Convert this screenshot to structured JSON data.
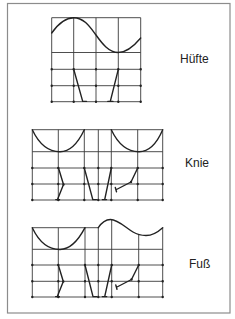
{
  "figure": {
    "frame_color": "#8c8c8c",
    "grid_color": "#3a3a3a",
    "line_color": "#222222",
    "text_color": "#222222"
  },
  "panels": [
    {
      "label": "Hüfte",
      "joint": "hip",
      "curve_shape": "sinusoid: peak at 1st gridline, trough at 3rd gridline",
      "grid": "M51.7,17.7V101.7M73.7,17.7V101.7M96,17.7V101.7M118.3,17.7V101.7M140.7,17.7V101.7M51.7,17.7H140.7M51.7,52.5H140.7M51.7,69.3H140.7M51.7,85.7H140.7M51.7,101.7H140.7",
      "curve": "M51.7,33C58,24 65,17.7 73.7,17.7C84,17.7 90,27 96,35C102,43.5 109,52.5 118.3,52.5C127,52.5 134,46 140.7,38",
      "legs": "M73.7,69.3L82.7,101.4H86.5M118.3,69.3L110.3,101.4M107.8,101.4H113",
      "joints": "M51.7,69.3h.01M73.7,69.3h.01M96,69.3h.01M118.3,69.3h.01M140.7,69.3h.01M51.7,85.7h.01M73.7,85.7h.01M96,85.7h.01M118.3,85.7h.01M140.7,85.7h.01M51.7,101.7h.01M73.7,101.7h.01M96,101.7h.01M118.3,101.7h.01M140.7,101.7h.01"
    },
    {
      "label": "Knie",
      "joint": "knee",
      "curve_shape": "two U-shaped flexion curves separated by flat segment",
      "grid": "M32.3,129.7V200M58.3,129.7V200M84.3,129.7V200M98.3,129.7V200M111.3,129.7V200M137.7,129.7V200M162.7,129.7V200M32.3,129.7H162.7M32.3,151.7H162.7M32.3,168H162.7M32.3,184H162.7M32.3,200H162.7",
      "curve": "M32.3,129.7C40,146 50,151.7 60,151.7C70,151.7 78,143 84.3,129.7M111.3,129.7C119,146 129,151.7 139,151.7C149,151.7 157,143 162.7,129.7",
      "legs": "M58.5,168L63.5,184.5L57.5,199.6M55.8,199.6H59.6M84.3,168L92.8,199.6H96.5M111.3,168L104.7,199.6M102.3,199.6H106.5M137.7,168L131,182L116.5,189.5M115.3,187.5L116.5,191.8",
      "joints": "M32.3,168h.01M58.3,168h.01M84.3,168h.01M98.3,168h.01M111.3,168h.01M137.7,168h.01M162.7,168h.01M32.3,184h.01M58.3,184h.01M84.3,184h.01M98.3,184h.01M111.3,184h.01M137.7,184h.01M162.7,184h.01M32.3,200h.01M58.3,200h.01M84.3,200h.01M98.3,200h.01M111.3,200h.01M137.7,200h.01M162.7,200h.01M63.5,184.5h.01M131,182h.01"
    },
    {
      "label": "Fuß",
      "joint": "foot",
      "curve_shape": "U-shaped dip, flat segment, then bump and shallow dip",
      "grid": "M32.3,227.7V297M58.3,227.7V297M85,227.7V297M98.3,227.7V297M111.7,220V297M138.7,234.5V297M162.7,227.7V297M32.3,227.7H98.3M32.3,249.3H162.7M32.3,265H162.7M32.3,281.3H162.7M32.3,297H162.7",
      "curve": "M32.3,227.7C40,244 50,249.5 60,249.5C70,249.5 78,241 85,227.7M98.3,227.7C102,222 106,219.5 110.5,219.5C118,219.5 126,228 133,232C138,235 142,235.5 146,235.5C152,235.5 158,232 162.7,227.7",
      "legs": "M58.3,265L63.3,281.5L57.3,296.6M55.6,296.6H59.4M85,265L93,296.6H96.7M111.7,265L104.7,296.6M102.3,296.6H106.7M138.7,265L131.5,279.5L117,287M115.8,285L117,289.3",
      "joints": "M32.3,265h.01M58.3,265h.01M85,265h.01M98.3,265h.01M111.7,265h.01M138.7,265h.01M162.7,265h.01M32.3,281.3h.01M58.3,281.3h.01M85,281.3h.01M98.3,281.3h.01M111.7,281.3h.01M138.7,281.3h.01M162.7,281.3h.01M32.3,297h.01M58.3,297h.01M85,297h.01M98.3,297h.01M111.7,297h.01M138.7,297h.01M162.7,297h.01M63.3,281.5h.01M131.5,279.5h.01"
    }
  ]
}
